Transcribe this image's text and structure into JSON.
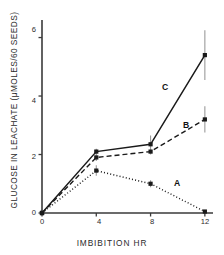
{
  "chart_data": {
    "type": "line",
    "title": "",
    "xlabel": "IMBIBITION HR",
    "ylabel": "GLUCOSE IN LEACHATE (μMOLES/60 SEEDS)",
    "x": [
      0,
      4,
      8,
      12
    ],
    "xlim": [
      0,
      12.6
    ],
    "ylim": [
      0,
      6.6
    ],
    "xticks": [
      "0",
      "4",
      "8",
      "12"
    ],
    "xtick_values": [
      0,
      4,
      8,
      12
    ],
    "yticks": [
      "0",
      "2",
      "4",
      "6"
    ],
    "ytick_values": [
      0,
      2,
      4,
      6
    ],
    "grid": false,
    "legend": "inline-labels",
    "marker": "square",
    "series": [
      {
        "name": "A",
        "label": "A",
        "linestyle": "dotted",
        "color": "#1a1a1a",
        "values": [
          0.0,
          1.45,
          1.0,
          0.05
        ],
        "errors": [
          0.0,
          0.18,
          0.12,
          0.0
        ]
      },
      {
        "name": "B",
        "label": "B",
        "linestyle": "dashed",
        "color": "#1a1a1a",
        "values": [
          0.0,
          1.9,
          2.1,
          3.2
        ],
        "errors": [
          0.0,
          0.12,
          0.1,
          0.45
        ]
      },
      {
        "name": "C",
        "label": "C",
        "linestyle": "solid",
        "color": "#1a1a1a",
        "values": [
          0.0,
          2.1,
          2.35,
          5.4
        ],
        "errors": [
          0.0,
          0.1,
          0.3,
          0.85
        ]
      }
    ]
  },
  "axes": {
    "ylabel_text": "GLUCOSE IN LEACHATE (μMOLES/60 SEEDS)",
    "xlabel_text": "IMBIBITION HR"
  },
  "ticklabels": {
    "y": [
      "6",
      "4",
      "2",
      "0"
    ],
    "x": [
      "0",
      "4",
      "8",
      "12"
    ]
  },
  "series_labels": {
    "a": "A",
    "b": "B",
    "c": "C"
  },
  "colors": {
    "axis": "#3a3a3a",
    "line": "#1a1a1a",
    "error": "#9a9a9a",
    "text": "#2b2b2b"
  }
}
